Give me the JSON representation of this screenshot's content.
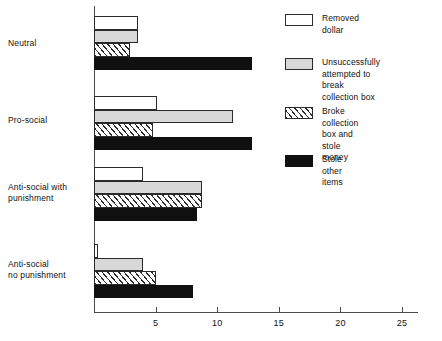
{
  "chart_data": {
    "type": "bar",
    "orientation": "horizontal",
    "title": "",
    "xlabel": "",
    "ylabel": "",
    "xlim": [
      0,
      27
    ],
    "grid": false,
    "legend_position": "right",
    "xticks": [
      5,
      10,
      15,
      20,
      25
    ],
    "categories": [
      "Neutral",
      "Pro-social",
      "Anti-social with\npunishment",
      "Anti-social\nno punishment"
    ],
    "series": [
      {
        "name": "Removed dollar",
        "fill": "open",
        "values": [
          3.6,
          5.1,
          4.0,
          0.3
        ]
      },
      {
        "name": "Unsuccessfully attempted to\nbreak collection box",
        "fill": "gray",
        "values": [
          3.6,
          11.3,
          8.8,
          4.0
        ]
      },
      {
        "name": "Broke collection box and\nstole money",
        "fill": "hatched",
        "values": [
          2.9,
          4.8,
          8.8,
          5.0
        ]
      },
      {
        "name": "Stole other items",
        "fill": "black",
        "values": [
          12.8,
          12.8,
          8.4,
          8.0
        ]
      }
    ]
  },
  "colors": {
    "axis": "#4a4a4a",
    "outline": "#2b2b2b",
    "gray_fill": "#d8d8d8",
    "black_fill": "#101010",
    "open_fill": "#ffffff",
    "text": "#111111"
  }
}
